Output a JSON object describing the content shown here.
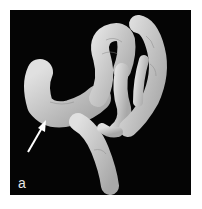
{
  "figure": {
    "panel_label": "a",
    "annotation": "arrow-pointing-to-colon-segment",
    "colors": {
      "background": "#050505",
      "tissue": "#c9c9c9",
      "arrow": "#ffffff",
      "page": "#ffffff"
    }
  }
}
